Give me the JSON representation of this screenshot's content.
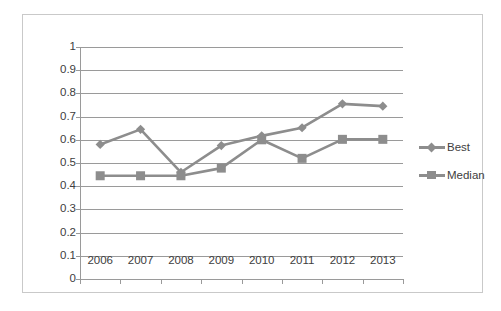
{
  "chart_data": {
    "type": "line",
    "title": "",
    "xlabel": "",
    "ylabel": "",
    "categories": [
      "2006",
      "2007",
      "2008",
      "2009",
      "2010",
      "2011",
      "2012",
      "2013"
    ],
    "series": [
      {
        "name": "Best",
        "marker": "diamond",
        "color": "#8d8d8d",
        "values": [
          0.58,
          0.645,
          0.46,
          0.575,
          0.617,
          0.652,
          0.755,
          0.745
        ]
      },
      {
        "name": "Median",
        "marker": "square",
        "color": "#8d8d8d",
        "values": [
          0.445,
          0.445,
          0.445,
          0.478,
          0.6,
          0.52,
          0.602,
          0.602
        ]
      }
    ],
    "ylim": [
      0,
      1
    ],
    "yticks": [
      "0",
      "0.1",
      "0.2",
      "0.3",
      "0.4",
      "0.5",
      "0.6",
      "0.7",
      "0.8",
      "0.9",
      "1"
    ],
    "grid": true,
    "legend_position": "right"
  },
  "legend": {
    "items": [
      {
        "label": "Best"
      },
      {
        "label": "Median"
      }
    ]
  },
  "colors": {
    "series": "#8d8d8d",
    "gridline": "#9a9a9a",
    "text": "#404040",
    "frame": "#c9c9c9",
    "background": "#ffffff"
  }
}
